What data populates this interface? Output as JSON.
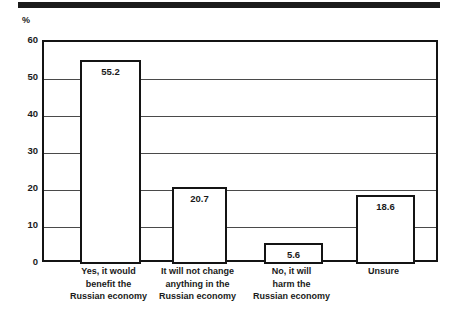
{
  "chart_data": {
    "type": "bar",
    "title": "",
    "subtitle": "",
    "xlabel": "",
    "ylabel": "%",
    "ylim": [
      0,
      60
    ],
    "ytick_values": [
      0,
      10,
      20,
      30,
      40,
      50,
      60
    ],
    "ytick_labels": [
      "0",
      "10",
      "20",
      "30",
      "40",
      "50",
      "60"
    ],
    "grid": true,
    "legend": false,
    "legend_position": "none",
    "categories": [
      "Yes, it would benefit the Russian economy",
      "It will not change anything in the Russian economy",
      "No, it will harm the Russian economy",
      "Unsure"
    ],
    "category_lines": [
      [
        "Yes, it would",
        "benefit the",
        "Russian economy"
      ],
      [
        "It will not change",
        "anything in the",
        "Russian economy"
      ],
      [
        "No, it will",
        "harm the",
        "Russian economy"
      ],
      [
        "Unsure"
      ]
    ],
    "values": [
      55.2,
      20.7,
      5.6,
      18.6
    ],
    "value_labels": [
      "55.2",
      "20.7",
      "5.6",
      "18.6"
    ],
    "colors": {
      "bar_fill": "#ffffff",
      "bar_stroke": "#141414",
      "frame": "#141414",
      "gridline": "#4a4a4a",
      "text": "#1a1a1a",
      "top_rule": "#1b1b1b"
    }
  },
  "axis": {
    "unit_label": "%"
  }
}
